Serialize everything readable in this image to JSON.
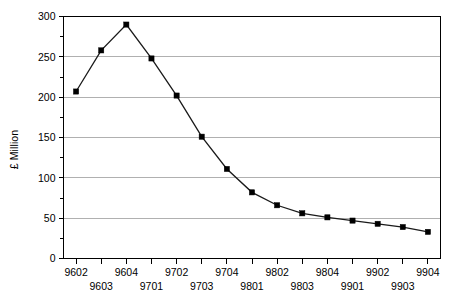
{
  "chart_data": {
    "type": "line",
    "title": "",
    "subtitle": "",
    "xlabel": "",
    "ylabel": "£ Million",
    "categories": [
      "9602",
      "9603",
      "9604",
      "9701",
      "9702",
      "9703",
      "9704",
      "9801",
      "9802",
      "9803",
      "9804",
      "9901",
      "9902",
      "9903",
      "9904"
    ],
    "values": [
      207,
      258,
      290,
      248,
      202,
      151,
      111,
      82,
      66,
      56,
      51,
      47,
      43,
      39,
      33
    ],
    "series": [
      {
        "name": "£ Million",
        "values": [
          207,
          258,
          290,
          248,
          202,
          151,
          111,
          82,
          66,
          56,
          51,
          47,
          43,
          39,
          33
        ]
      }
    ],
    "ylim": [
      0,
      300
    ],
    "y_major_ticks": [
      0,
      50,
      100,
      150,
      200,
      250,
      300
    ],
    "y_minor_ticks": [
      25,
      75,
      125,
      175,
      225,
      275
    ],
    "y_tick_labels": [
      "0",
      "50",
      "100",
      "150",
      "200",
      "250",
      "300"
    ],
    "x_tick_labels": [
      "9602",
      "9603",
      "9604",
      "9701",
      "9702",
      "9703",
      "9704",
      "9801",
      "9802",
      "9803",
      "9804",
      "9901",
      "9902",
      "9903",
      "9904"
    ],
    "grid": "horizontal",
    "legend": "none",
    "marker": "square",
    "annotations": []
  },
  "style": {
    "line_color": "#1a1a1a",
    "marker_color": "#000000",
    "grid_color": "#b0b0b0",
    "axis_color": "#000000",
    "background": "#ffffff",
    "text_color": "#000000"
  }
}
